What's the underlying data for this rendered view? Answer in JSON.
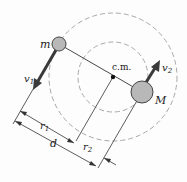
{
  "diagram": {
    "labels": {
      "small_mass": "m",
      "large_mass": "M",
      "center_of_mass": "c.m.",
      "velocity_1": "v",
      "velocity_1_sub": "1",
      "velocity_2": "v",
      "velocity_2_sub": "2",
      "radius_1": "r",
      "radius_1_sub": "1",
      "radius_2": "r",
      "radius_2_sub": "2",
      "separation": "d"
    },
    "colors": {
      "mass_fill": "#b8b8b8",
      "line": "#333333",
      "arrow": "#3a3a3a",
      "orbit_dash": "#a0a0a0"
    }
  }
}
